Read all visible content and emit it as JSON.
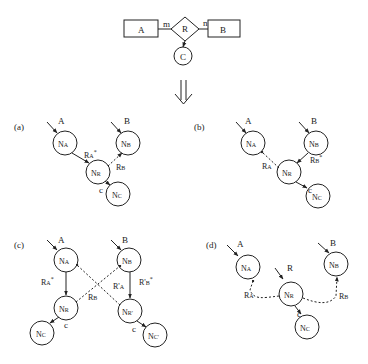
{
  "er_model": {
    "entity_a": "A",
    "entity_b": "B",
    "relationship": "R",
    "attribute": "C",
    "card_a": "m",
    "card_b": "n"
  },
  "transform_arrow": "⇓",
  "panels": [
    {
      "label": "(a)",
      "inputs": {
        "a": "A",
        "b": "B"
      },
      "nodes": {
        "na": "N",
        "na_sub": "A",
        "nb": "N",
        "nb_sub": "B",
        "nr": "N",
        "nr_sub": "R",
        "nc": "N",
        "nc_sub": "C"
      },
      "edges": {
        "ra": "R",
        "ra_sub": "A",
        "ra_star": "*",
        "rb": "R",
        "rb_sub": "B",
        "c": "c"
      }
    },
    {
      "label": "(b)",
      "inputs": {
        "a": "A",
        "b": "B"
      },
      "nodes": {
        "na": "N",
        "na_sub": "A",
        "nb": "N",
        "nb_sub": "B",
        "nr": "N",
        "nr_sub": "R",
        "nc": "N",
        "nc_sub": "C"
      },
      "edges": {
        "ra": "R",
        "ra_sub": "A",
        "rb": "R",
        "rb_sub": "B",
        "rb_star": "*",
        "c": "c"
      }
    },
    {
      "label": "(c)",
      "inputs": {
        "a": "A",
        "b": "B"
      },
      "nodes": {
        "na": "N",
        "na_sub": "A",
        "nb": "N",
        "nb_sub": "B",
        "nr": "N",
        "nr_sub": "R",
        "nr2": "N",
        "nr2_sub": "R'",
        "nc": "N",
        "nc_sub": "C",
        "nc2": "N",
        "nc2_sub": "C'"
      },
      "edges": {
        "ra": "R",
        "ra_sub": "A",
        "ra_star": "*",
        "rb": "R",
        "rb_sub": "B",
        "ra2": "R'",
        "ra2_sub": "A",
        "rb2": "R'",
        "rb2_sub": "B",
        "rb2_star": "*",
        "c": "c",
        "c2": "c"
      }
    },
    {
      "label": "(d)",
      "inputs": {
        "a": "A",
        "b": "B",
        "r": "R"
      },
      "nodes": {
        "na": "N",
        "na_sub": "A",
        "nb": "N",
        "nb_sub": "B",
        "nr": "N",
        "nr_sub": "R",
        "nc": "N",
        "nc_sub": "C"
      },
      "edges": {
        "ra": "R",
        "ra_sub": "A",
        "rb": "R",
        "rb_sub": "B",
        "c": "c"
      }
    }
  ],
  "colors": {
    "stroke": "#222222",
    "background": "#ffffff"
  }
}
